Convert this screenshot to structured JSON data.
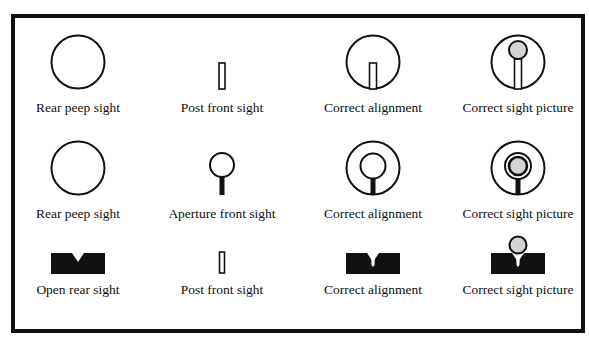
{
  "figure": {
    "rows": [
      {
        "cells": [
          {
            "label": "Rear peep sight",
            "icon": "peep-ring"
          },
          {
            "label": "Post front sight",
            "icon": "post"
          },
          {
            "label": "Correct alignment",
            "icon": "peep-with-post"
          },
          {
            "label": "Correct sight picture",
            "icon": "peep-post-target"
          }
        ]
      },
      {
        "cells": [
          {
            "label": "Rear peep sight",
            "icon": "peep-ring"
          },
          {
            "label": "Aperture front sight",
            "icon": "aperture"
          },
          {
            "label": "Correct alignment",
            "icon": "peep-with-aperture"
          },
          {
            "label": "Correct sight picture",
            "icon": "peep-aperture-target"
          }
        ]
      },
      {
        "cells": [
          {
            "label": "Open rear sight",
            "icon": "v-notch"
          },
          {
            "label": "Post front sight",
            "icon": "post"
          },
          {
            "label": "Correct alignment",
            "icon": "notch-with-post"
          },
          {
            "label": "Correct sight picture",
            "icon": "notch-post-target"
          }
        ]
      }
    ],
    "colors": {
      "ink": "#111111",
      "target_fill": "#d4d4d4",
      "background": "#ffffff"
    }
  }
}
